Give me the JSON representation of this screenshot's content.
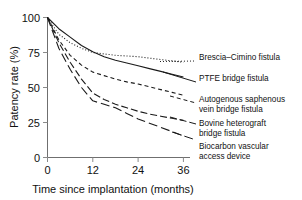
{
  "chart_data": {
    "type": "line",
    "title": "",
    "xlabel": "Time since implantation (months)",
    "ylabel": "Patency rate (%)",
    "xlim": [
      0,
      38
    ],
    "ylim": [
      0,
      100
    ],
    "xticks": [
      0,
      12,
      24,
      36
    ],
    "yticks": [
      0,
      25,
      50,
      75,
      100
    ],
    "xtick_labels": [
      "0",
      "12",
      "24",
      "36"
    ],
    "ytick_labels": [
      "0",
      "25",
      "50",
      "75",
      "100"
    ],
    "grid": false,
    "legend_position": "right-inline-labels",
    "x": [
      0,
      3,
      6,
      9,
      12,
      15,
      18,
      21,
      24,
      27,
      30,
      33,
      36
    ],
    "series": [
      {
        "name": "Brescia-Cimino fistula",
        "label": "Brescia–Cimino fistula",
        "style": "dotted",
        "values": [
          100,
          88,
          82,
          78,
          75,
          74,
          73,
          72.5,
          72,
          71,
          70,
          69,
          68
        ]
      },
      {
        "name": "PTFE bridge fistula",
        "label": "PTFE bridge fistula",
        "style": "solid",
        "values": [
          100,
          92,
          86,
          80,
          75.5,
          72,
          69.5,
          67.5,
          65.5,
          63.5,
          61.5,
          59.5,
          57.5
        ]
      },
      {
        "name": "Autogenous saphenous vein bridge fistula",
        "label": "Autogenous saphenous vein bridge fistula",
        "style": "dashed-short",
        "values": [
          100,
          84,
          73,
          66,
          61,
          58.5,
          56,
          54,
          52.5,
          50.5,
          48.5,
          46.5,
          44.5
        ]
      },
      {
        "name": "Bovine heterograft bridge fistula",
        "label": "Bovine heterograft bridge fistula",
        "style": "dashed-long",
        "values": [
          100,
          82,
          68,
          56,
          46,
          41.5,
          38,
          35.5,
          33,
          31,
          29.5,
          28,
          26.5
        ]
      },
      {
        "name": "Biocarbon vascular access device",
        "label": "Biocarbon vascular access device",
        "style": "dashed-mixed",
        "values": [
          100,
          78,
          63,
          50,
          40.5,
          38,
          35.5,
          31.5,
          27.5,
          24.5,
          21.5,
          18.5,
          15.5
        ]
      }
    ],
    "annotations": [
      {
        "label": "Brescia–Cimino fistula"
      },
      {
        "label": "PTFE bridge fistula"
      },
      {
        "label": "Autogenous saphenous"
      },
      {
        "label": "vein bridge fistula"
      },
      {
        "label": "Bovine heterograft"
      },
      {
        "label": "bridge fistula"
      },
      {
        "label": "Biocarbon vascular"
      },
      {
        "label": "access device"
      }
    ]
  },
  "axes": {
    "ylabel": "Patency rate (%)",
    "xlabel": "Time since implantation (months)",
    "xtick_0": "0",
    "xtick_1": "12",
    "xtick_2": "24",
    "xtick_3": "36",
    "ytick_0": "0",
    "ytick_1": "25",
    "ytick_2": "50",
    "ytick_3": "75",
    "ytick_4": "100"
  },
  "legend": {
    "line1": "Brescia–Cimino fistula",
    "line2": "PTFE bridge fistula",
    "line3a": "Autogenous saphenous",
    "line3b": "vein bridge fistula",
    "line4a": "Bovine heterograft",
    "line4b": "bridge fistula",
    "line5a": "Biocarbon vascular",
    "line5b": "access device"
  },
  "colors": {
    "line": "#1a1a1a",
    "axis": "#6f6f6f",
    "background": "#ffffff"
  }
}
